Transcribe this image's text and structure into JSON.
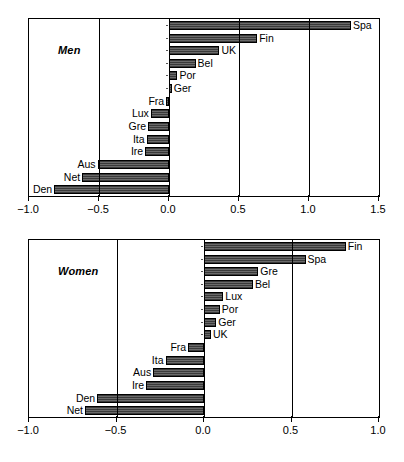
{
  "chart_data": [
    {
      "type": "bar",
      "orientation": "horizontal",
      "title": "Men",
      "xlabel": "",
      "ylabel": "",
      "xlim": [
        -1.0,
        1.5
      ],
      "xticks": [
        -1.0,
        -0.5,
        0.0,
        0.5,
        1.0,
        1.5
      ],
      "xticklabels": [
        "−1.0",
        "−0.5",
        "0.0",
        "0.5",
        "1.0",
        "1.5"
      ],
      "grid": "vertical-at-ticks",
      "legend": "none",
      "categories": [
        "Spa",
        "Fin",
        "UK",
        "Bel",
        "Por",
        "Ger",
        "Fra",
        "Lux",
        "Gre",
        "Ita",
        "Ire",
        "Aus",
        "Net",
        "Den"
      ],
      "values": [
        1.3,
        0.63,
        0.36,
        0.19,
        0.06,
        0.02,
        -0.02,
        -0.13,
        -0.15,
        -0.16,
        -0.17,
        -0.51,
        -0.62,
        -0.82
      ]
    },
    {
      "type": "bar",
      "orientation": "horizontal",
      "title": "Women",
      "xlabel": "",
      "ylabel": "",
      "xlim": [
        -1.0,
        1.0
      ],
      "xticks": [
        -1.0,
        -0.5,
        0.0,
        0.5,
        1.0
      ],
      "xticklabels": [
        "−1.0",
        "−0.5",
        "0.0",
        "0.5",
        "1.0"
      ],
      "grid": "vertical-at-ticks",
      "legend": "none",
      "categories": [
        "Fin",
        "Spa",
        "Gre",
        "Bel",
        "Lux",
        "Por",
        "Ger",
        "UK",
        "Fra",
        "Ita",
        "Aus",
        "Ire",
        "Den",
        "Net"
      ],
      "values": [
        0.81,
        0.58,
        0.31,
        0.28,
        0.11,
        0.09,
        0.07,
        0.04,
        -0.09,
        -0.22,
        -0.29,
        -0.33,
        -0.61,
        -0.68
      ]
    }
  ],
  "panels": {
    "men": {
      "label": "Men"
    },
    "women": {
      "label": "Women"
    }
  }
}
